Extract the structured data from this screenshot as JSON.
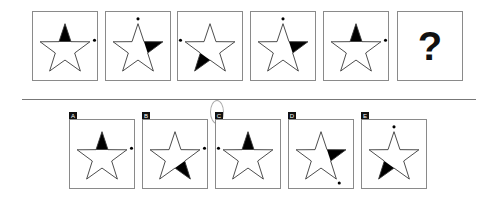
{
  "puzzle": {
    "sequence": [
      {
        "id": "p1",
        "filled_point": "top",
        "dot": "right"
      },
      {
        "id": "p2",
        "filled_point": "right",
        "dot": "top"
      },
      {
        "id": "p3",
        "filled_point": "bottom-left",
        "dot": "left"
      },
      {
        "id": "p4",
        "filled_point": "right",
        "dot": "top"
      },
      {
        "id": "p5",
        "filled_point": "top",
        "dot": "right"
      },
      {
        "id": "p6",
        "question": "?"
      }
    ],
    "options": [
      {
        "label": "A",
        "filled_point": "top",
        "dot": "right"
      },
      {
        "label": "B",
        "filled_point": "bottom-right",
        "dot": "right"
      },
      {
        "label": "C",
        "filled_point": "top",
        "dot": "left"
      },
      {
        "label": "D",
        "filled_point": "right",
        "dot": "bottom-right"
      },
      {
        "label": "E",
        "filled_point": "bottom-left",
        "dot": "top"
      }
    ]
  },
  "colors": {
    "stroke": "#333333",
    "fill": "#000000",
    "border": "#8a8a8a"
  }
}
